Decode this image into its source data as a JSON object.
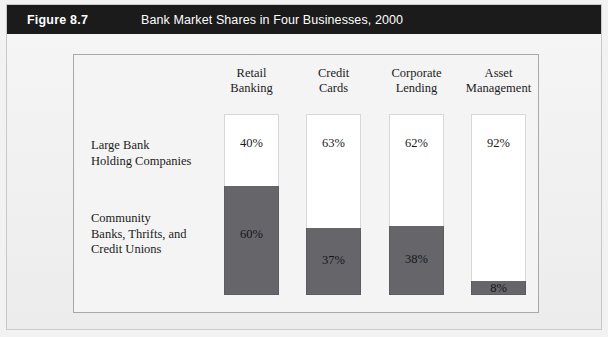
{
  "figure": {
    "number": "Figure 8.7",
    "title": "Bank Market Shares in Four Businesses, 2000"
  },
  "colors": {
    "header_bar": "#1b1b1b",
    "header_text": "#ffffff",
    "page_background": "#f2f2f2",
    "panel_background": "#f4f4f4",
    "panel_border": "#a8a8a8",
    "segment_large_bank": "#ffffff",
    "segment_community": "#66666a",
    "text": "#1b1b1b"
  },
  "row_labels": {
    "top": [
      "Large Bank",
      "Holding Companies"
    ],
    "bottom": [
      "Community",
      "Banks, Thrifts, and",
      "Credit Unions"
    ]
  },
  "columns": [
    {
      "header": [
        "Retail",
        "Banking"
      ],
      "large_bank_label": "40%",
      "community_label": "60%"
    },
    {
      "header": [
        "Credit",
        "Cards"
      ],
      "large_bank_label": "63%",
      "community_label": "37%"
    },
    {
      "header": [
        "Corporate",
        "Lending"
      ],
      "large_bank_label": "62%",
      "community_label": "38%"
    },
    {
      "header": [
        "Asset",
        "Management"
      ],
      "large_bank_label": "92%",
      "community_label": "8%"
    }
  ],
  "chart_data": {
    "type": "bar",
    "title": "Bank Market Shares in Four Businesses, 2000",
    "subtitle": "Figure 8.7",
    "xlabel": "",
    "ylabel": "",
    "ylim": [
      0,
      100
    ],
    "stacked": true,
    "grid": false,
    "legend_position": "left-row-labels",
    "categories": [
      "Retail Banking",
      "Credit Cards",
      "Corporate Lending",
      "Asset Management"
    ],
    "series": [
      {
        "name": "Large Bank Holding Companies",
        "color": "#ffffff",
        "values": [
          40,
          63,
          62,
          92
        ],
        "labels": [
          "40%",
          "63%",
          "62%",
          "92%"
        ]
      },
      {
        "name": "Community Banks, Thrifts, and Credit Unions",
        "color": "#66666a",
        "values": [
          60,
          37,
          38,
          8
        ],
        "labels": [
          "60%",
          "37%",
          "38%",
          "8%"
        ]
      }
    ]
  }
}
